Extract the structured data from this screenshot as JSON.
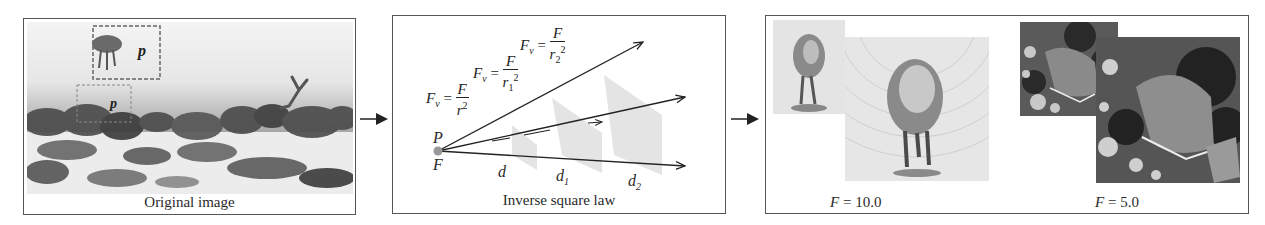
{
  "figure": {
    "panels": [
      {
        "id": "original",
        "caption": "Original image",
        "markers": [
          {
            "label": "p",
            "box": "upper-dashed"
          },
          {
            "label": "p",
            "box": "lower-dashed"
          }
        ]
      },
      {
        "id": "inverse-square",
        "caption": "Inverse square law",
        "source_point_top": "P",
        "source_point_bottom": "F",
        "formulas": [
          {
            "lhs": "F",
            "lhs_sub": "v",
            "num": "F",
            "den": "r",
            "den_sub": "",
            "den_sup": "2"
          },
          {
            "lhs": "F",
            "lhs_sub": "v",
            "num": "F",
            "den": "r",
            "den_sub": "1",
            "den_sup": "2"
          },
          {
            "lhs": "F",
            "lhs_sub": "v",
            "num": "F",
            "den": "r",
            "den_sub": "2",
            "den_sup": "2"
          }
        ],
        "distances": [
          {
            "base": "d",
            "sub": ""
          },
          {
            "base": "d",
            "sub": "1"
          },
          {
            "base": "d",
            "sub": "2"
          }
        ]
      },
      {
        "id": "results",
        "results": [
          {
            "var": "F",
            "eq": " = 10.0",
            "subject": "jellyfish"
          },
          {
            "var": "F",
            "eq": " = 5.0",
            "subject": "seabed"
          }
        ]
      }
    ],
    "colors": {
      "border": "#555555",
      "arrow": "#222222",
      "source_dot": "#999999",
      "shade": "#d8d8d8"
    }
  }
}
